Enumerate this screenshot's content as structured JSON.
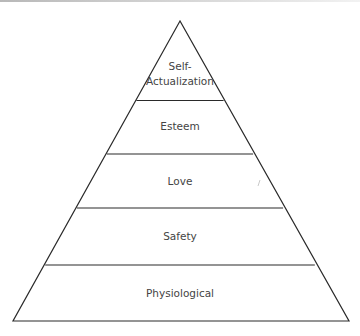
{
  "diagram": {
    "type": "pyramid",
    "levels": [
      {
        "label_line1": "Self-",
        "label_line2": "Actualization"
      },
      {
        "label": "Esteem"
      },
      {
        "label": "Love"
      },
      {
        "label": "Safety"
      },
      {
        "label": "Physiological"
      }
    ],
    "colors": {
      "stroke": "#2a2a2a",
      "fill": "#ffffff",
      "text": "#444444"
    }
  }
}
